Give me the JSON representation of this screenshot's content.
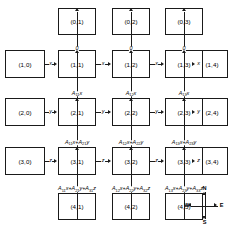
{
  "diagram": {
    "type": "systolic-array-dataflow-grid",
    "grid": {
      "rows": 5,
      "cols": 5,
      "inner_rows": [
        1,
        2,
        3
      ],
      "inner_cols": [
        1,
        2,
        3
      ]
    },
    "nodes": {
      "top_boundary": [
        {
          "id": "0-1",
          "label": "(0,1)",
          "row": 0,
          "col": 1
        },
        {
          "id": "0-2",
          "label": "(0,2)",
          "row": 0,
          "col": 2
        },
        {
          "id": "0-3",
          "label": "(0,3)",
          "row": 0,
          "col": 3
        }
      ],
      "left_boundary": [
        {
          "id": "1-0",
          "label": "(1,0)",
          "row": 1,
          "col": 0
        },
        {
          "id": "2-0",
          "label": "(2,0)",
          "row": 2,
          "col": 0
        },
        {
          "id": "3-0",
          "label": "(3,0)",
          "row": 3,
          "col": 0
        }
      ],
      "right_boundary": [
        {
          "id": "1-4",
          "label": "(1,4)",
          "row": 1,
          "col": 4
        },
        {
          "id": "2-4",
          "label": "(2,4)",
          "row": 2,
          "col": 4
        },
        {
          "id": "3-4",
          "label": "(3,4)",
          "row": 3,
          "col": 4
        }
      ],
      "bottom_boundary": [
        {
          "id": "4-1",
          "label": "(4,1)",
          "row": 4,
          "col": 1
        },
        {
          "id": "4-2",
          "label": "(4,2)",
          "row": 4,
          "col": 2
        },
        {
          "id": "4-3",
          "label": "(4,3)",
          "row": 4,
          "col": 3
        }
      ],
      "interior": [
        {
          "id": "1-1",
          "label": "(1,1)",
          "row": 1,
          "col": 1
        },
        {
          "id": "1-2",
          "label": "(1,2)",
          "row": 1,
          "col": 2
        },
        {
          "id": "1-3",
          "label": "(1,3)",
          "row": 1,
          "col": 3
        },
        {
          "id": "2-1",
          "label": "(2,1)",
          "row": 2,
          "col": 1
        },
        {
          "id": "2-2",
          "label": "(2,2)",
          "row": 2,
          "col": 2
        },
        {
          "id": "2-3",
          "label": "(2,3)",
          "row": 2,
          "col": 3
        },
        {
          "id": "3-1",
          "label": "(3,1)",
          "row": 3,
          "col": 1
        },
        {
          "id": "3-2",
          "label": "(3,2)",
          "row": 3,
          "col": 2
        },
        {
          "id": "3-3",
          "label": "(3,3)",
          "row": 3,
          "col": 3
        }
      ]
    },
    "edge_labels": {
      "vertical_into_row1": [
        "0",
        "0",
        "0"
      ],
      "horizontal_row1": [
        "x",
        "x",
        "x",
        "x"
      ],
      "horizontal_row2": [
        "y",
        "y",
        "y",
        "y"
      ],
      "horizontal_row3": [
        "z",
        "z",
        "z",
        "z"
      ],
      "vertical_row1_to_row2": [
        {
          "parts": [
            {
              "a": "A",
              "sub": "11",
              "var": "x"
            }
          ]
        },
        {
          "parts": [
            {
              "a": "A",
              "sub": "12",
              "var": "x"
            }
          ]
        },
        {
          "parts": [
            {
              "a": "A",
              "sub": "13",
              "var": "x"
            }
          ]
        }
      ],
      "vertical_row2_to_row3": [
        {
          "parts": [
            {
              "a": "A",
              "sub": "11",
              "var": "x"
            },
            {
              "a": "A",
              "sub": "21",
              "var": "y"
            }
          ]
        },
        {
          "parts": [
            {
              "a": "A",
              "sub": "12",
              "var": "x"
            },
            {
              "a": "A",
              "sub": "22",
              "var": "y"
            }
          ]
        },
        {
          "parts": [
            {
              "a": "A",
              "sub": "13",
              "var": "x"
            },
            {
              "a": "A",
              "sub": "23",
              "var": "y"
            }
          ]
        }
      ],
      "vertical_row3_to_row4": [
        {
          "parts": [
            {
              "a": "A",
              "sub": "11",
              "var": "x"
            },
            {
              "a": "A",
              "sub": "21",
              "var": "y"
            },
            {
              "a": "A",
              "sub": "31",
              "var": "z"
            }
          ]
        },
        {
          "parts": [
            {
              "a": "A",
              "sub": "12",
              "var": "x"
            },
            {
              "a": "A",
              "sub": "22",
              "var": "y"
            },
            {
              "a": "A",
              "sub": "32",
              "var": "z"
            }
          ]
        },
        {
          "parts": [
            {
              "a": "A",
              "sub": "13",
              "var": "x"
            },
            {
              "a": "A",
              "sub": "23",
              "var": "y"
            },
            {
              "a": "A",
              "sub": "33",
              "var": "z"
            }
          ]
        }
      ]
    }
  },
  "compass": {
    "north": "N",
    "south": "S",
    "east": "E",
    "west": "W"
  },
  "colors": {
    "stroke": "#1a1a1a",
    "background": "#ffffff",
    "text": "#000000"
  }
}
